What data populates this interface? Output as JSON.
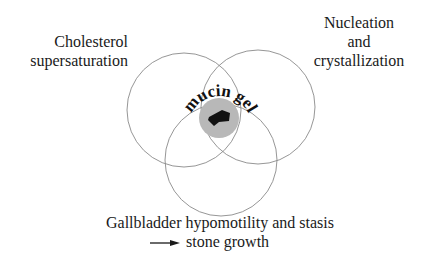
{
  "labels": {
    "cholesterol_line1": "Cholesterol",
    "cholesterol_line2": "supersaturation",
    "nucleation_line1": "Nucleation",
    "nucleation_line2": "and",
    "nucleation_line3": "crystallization",
    "gallbladder": "Gallbladder hypomotility and stasis",
    "stone_growth": "stone growth",
    "center": "mucin gel"
  },
  "colors": {
    "circle_stroke": "#8a8a8a",
    "gel_fill": "#b8b8b8",
    "stone_fill": "#111111",
    "text": "#1a1a1a"
  }
}
